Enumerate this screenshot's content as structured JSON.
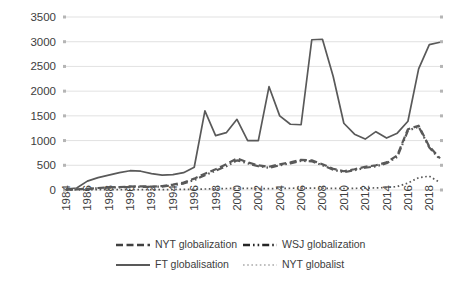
{
  "chart_data": {
    "type": "line",
    "title": "",
    "subtitle": "",
    "xlabel": "",
    "ylabel": "",
    "ylim": [
      0,
      3500
    ],
    "ytick_step": 500,
    "ytick_labels": [
      "0",
      "500",
      "1000",
      "1500",
      "2000",
      "2500",
      "3000",
      "3500"
    ],
    "xlim": [
      1984,
      2019
    ],
    "xtick_labels": [
      "1984",
      "1986",
      "1988",
      "1990",
      "1992",
      "1994",
      "1996",
      "1998",
      "2000",
      "2002",
      "2004",
      "2006",
      "2008",
      "2010",
      "2012",
      "2014",
      "2016",
      "2018"
    ],
    "x": [
      1984,
      1985,
      1986,
      1987,
      1988,
      1989,
      1990,
      1991,
      1992,
      1993,
      1994,
      1995,
      1996,
      1997,
      1998,
      1999,
      2000,
      2001,
      2002,
      2003,
      2004,
      2005,
      2006,
      2007,
      2008,
      2009,
      2010,
      2011,
      2012,
      2013,
      2014,
      2015,
      2016,
      2017,
      2018,
      2019
    ],
    "grid": "horizontal",
    "legend_position": "bottom",
    "series": [
      {
        "name": "NYT globalization",
        "style": "dashed",
        "color": "#404040",
        "values": [
          10,
          15,
          25,
          40,
          55,
          60,
          70,
          75,
          70,
          80,
          110,
          150,
          230,
          330,
          420,
          520,
          640,
          560,
          500,
          470,
          520,
          560,
          610,
          600,
          520,
          430,
          380,
          420,
          470,
          500,
          560,
          700,
          1230,
          1300,
          880,
          640
        ]
      },
      {
        "name": "WSJ globalization",
        "style": "dash-dot",
        "color": "#262626",
        "values": [
          8,
          12,
          20,
          35,
          50,
          55,
          60,
          65,
          62,
          70,
          95,
          130,
          200,
          300,
          390,
          480,
          600,
          540,
          480,
          450,
          500,
          540,
          590,
          580,
          500,
          410,
          360,
          400,
          450,
          480,
          540,
          670,
          1200,
          1280,
          860,
          620
        ]
      },
      {
        "name": "FT globalisation",
        "style": "solid",
        "color": "#595959",
        "values": [
          20,
          40,
          180,
          250,
          300,
          350,
          390,
          380,
          330,
          300,
          310,
          350,
          460,
          1600,
          1100,
          1160,
          1430,
          1000,
          1000,
          2090,
          1500,
          1330,
          1320,
          3040,
          3050,
          2300,
          1350,
          1130,
          1030,
          1180,
          1050,
          1150,
          1390,
          2450,
          2940,
          2990
        ]
      },
      {
        "name": "NYT globalist",
        "style": "dotted",
        "color": "#bfbfbf",
        "values": [
          2,
          3,
          4,
          5,
          6,
          7,
          8,
          8,
          7,
          8,
          10,
          12,
          15,
          20,
          25,
          30,
          35,
          32,
          30,
          28,
          32,
          35,
          38,
          40,
          36,
          32,
          30,
          34,
          38,
          42,
          50,
          70,
          140,
          250,
          280,
          150
        ]
      }
    ]
  },
  "legend": {
    "items": [
      {
        "label": "NYT globalization",
        "style": "dashed"
      },
      {
        "label": "WSJ globalization",
        "style": "dash-dot"
      },
      {
        "label": "FT globalisation",
        "style": "solid"
      },
      {
        "label": "NYT globalist",
        "style": "dotted"
      }
    ]
  }
}
